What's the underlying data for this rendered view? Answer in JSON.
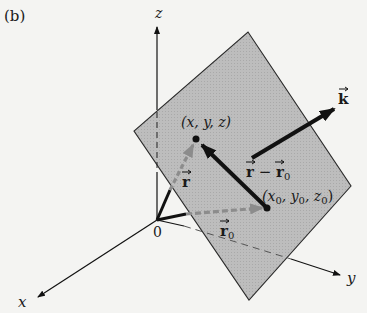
{
  "figure": {
    "panel_label": "(b)",
    "axes": {
      "x_label": "x",
      "y_label": "y",
      "z_label": "z",
      "origin_label": "0"
    },
    "points": {
      "general": "(x, y, z)",
      "fixed_x": "x",
      "fixed_y": "y",
      "fixed_z": "z",
      "fixed_sub": "0"
    },
    "vectors": {
      "position": "r",
      "position_fixed": "r",
      "position_fixed_sub": "0",
      "difference_a": "r",
      "difference_minus": " − ",
      "difference_b": "r",
      "difference_sub": "0",
      "normal": "k"
    },
    "colors": {
      "background": "#f4f4f2",
      "plane_fill": "#b9b9b9",
      "plane_edge": "#2a2a2a",
      "ink": "#111111",
      "dashed_vector": "#8c8c8c"
    }
  }
}
